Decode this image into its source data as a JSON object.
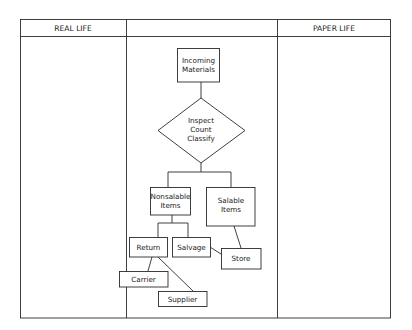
{
  "table": {
    "headers": [
      {
        "label": "REAL LIFE"
      },
      {
        "label": ""
      },
      {
        "label": "PAPER LIFE"
      }
    ]
  },
  "flowchart": {
    "incoming": {
      "lines": [
        "Incoming",
        "Materials"
      ]
    },
    "decision": {
      "lines": [
        "Inspect",
        "Count",
        "Classify"
      ]
    },
    "nonsalable": {
      "lines": [
        "Nonsalable",
        "Items"
      ]
    },
    "salable": {
      "lines": [
        "Salable",
        "Items"
      ]
    },
    "return": {
      "label": "Return"
    },
    "salvage": {
      "label": "Salvage"
    },
    "store": {
      "label": "Store"
    },
    "carrier": {
      "label": "Carrier"
    },
    "supplier": {
      "label": "Supplier"
    }
  },
  "colors": {
    "line": "#2a2a2a",
    "background": "#ffffff",
    "text": "#222222"
  }
}
